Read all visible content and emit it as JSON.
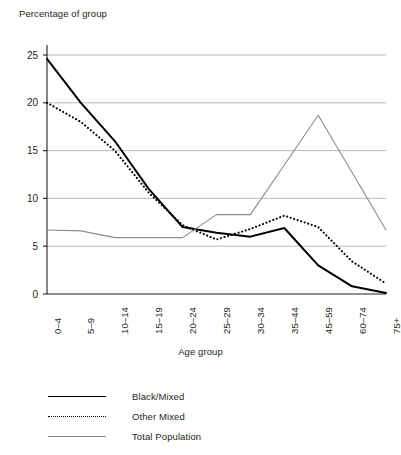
{
  "chart_data": {
    "type": "line",
    "title": "",
    "ylabel": "Percentage of group",
    "xlabel": "Age group",
    "categories": [
      "0–4",
      "5–9",
      "10–14",
      "15–19",
      "20–24",
      "25–29",
      "30–34",
      "35–44",
      "45–59",
      "60–74",
      "75+"
    ],
    "ylim": [
      0,
      25
    ],
    "yticks": [
      0,
      5,
      10,
      15,
      20,
      25
    ],
    "ytick_labels": [
      "0",
      "5",
      "10",
      "15",
      "20",
      "25"
    ],
    "grid": "horizontal",
    "legend_position": "bottom-left",
    "series": [
      {
        "name": "Black/Mixed",
        "style": "solid",
        "color": "#000000",
        "values": [
          24.6,
          20.0,
          16.0,
          11.0,
          7.0,
          6.4,
          6.0,
          6.9,
          3.0,
          0.8,
          0.1
        ]
      },
      {
        "name": "Other Mixed",
        "style": "dotted",
        "color": "#000000",
        "values": [
          20.0,
          18.0,
          15.0,
          10.6,
          7.2,
          5.7,
          6.8,
          8.2,
          7.0,
          3.4,
          1.1
        ]
      },
      {
        "name": "Total Population",
        "style": "thin-solid",
        "color": "#8c8c8c",
        "values": [
          6.7,
          6.6,
          5.9,
          5.9,
          5.9,
          8.3,
          8.3,
          13.5,
          18.7,
          12.7,
          6.7
        ]
      }
    ]
  },
  "legend": {
    "items": [
      {
        "label": "Black/Mixed"
      },
      {
        "label": "Other Mixed"
      },
      {
        "label": "Total Population"
      }
    ]
  },
  "colors": {
    "series_primary": "#000000",
    "series_total": "#8c8c8c",
    "grid": "#b3b3b3",
    "axis": "#231f20",
    "background": "#ffffff"
  }
}
